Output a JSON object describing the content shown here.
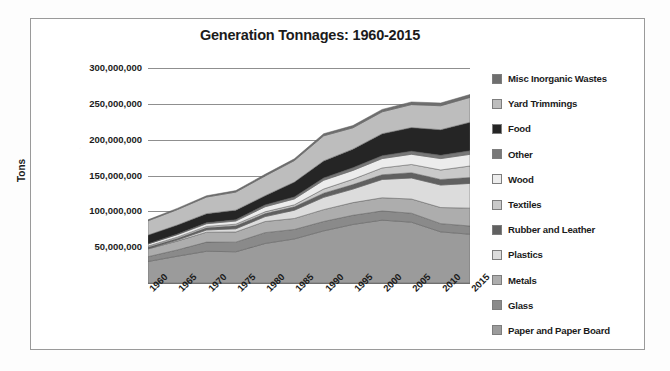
{
  "chart_data": {
    "type": "area",
    "stacked": true,
    "title": "Generation Tonnages: 1960-2015",
    "xlabel": "",
    "ylabel": "Tons",
    "grid": true,
    "legend_position": "right",
    "ylim": [
      0,
      300000000
    ],
    "yticks": [
      300000000,
      250000000,
      200000000,
      150000000,
      100000000,
      50000000
    ],
    "ytick_labels": [
      "300,000,000",
      "250,000,000",
      "200,000,000",
      "150,000,000",
      "100,000,000",
      "50,000,000"
    ],
    "x": [
      1960,
      1965,
      1970,
      1975,
      1980,
      1985,
      1990,
      1995,
      2000,
      2005,
      2010,
      2015
    ],
    "xtick_labels": [
      "1960",
      "1965",
      "1970",
      "1975",
      "1980",
      "1985",
      "1990",
      "1995",
      "2000",
      "2005",
      "2010",
      "2015"
    ],
    "series": [
      {
        "name": "Paper and Paper Board",
        "color": "#9b9b9b",
        "values": [
          29990000,
          37380000,
          44310000,
          43560000,
          55160000,
          61500000,
          72730000,
          81670000,
          87740000,
          84840000,
          71310000,
          68050000
        ]
      },
      {
        "name": "Glass",
        "color": "#8a8a8a",
        "values": [
          6720000,
          8740000,
          12740000,
          13470000,
          15130000,
          13200000,
          13100000,
          12830000,
          12770000,
          12540000,
          11530000,
          11470000
        ]
      },
      {
        "name": "Metals",
        "color": "#adadad",
        "values": [
          10820000,
          12360000,
          13830000,
          14180000,
          15510000,
          15330000,
          16550000,
          17660000,
          18420000,
          19800000,
          22430000,
          24950000
        ]
      },
      {
        "name": "Plastics",
        "color": "#dcdcdc",
        "values": [
          390000,
          1430000,
          3080000,
          4450000,
          6830000,
          11540000,
          17130000,
          18920000,
          25550000,
          29380000,
          31400000,
          34500000
        ]
      },
      {
        "name": "Rubber and Leather",
        "color": "#606060",
        "values": [
          1840000,
          2170000,
          2970000,
          4200000,
          4200000,
          4740000,
          5790000,
          6260000,
          6580000,
          7310000,
          7770000,
          8260000
        ]
      },
      {
        "name": "Textiles",
        "color": "#c9c9c9",
        "values": [
          1760000,
          1930000,
          2040000,
          2230000,
          2530000,
          2790000,
          5810000,
          7400000,
          9480000,
          11500000,
          13250000,
          16030000
        ]
      },
      {
        "name": "Wood",
        "color": "#ececec",
        "values": [
          3030000,
          3430000,
          3720000,
          4400000,
          7010000,
          8220000,
          12210000,
          12340000,
          13100000,
          14280000,
          15920000,
          16300000
        ]
      },
      {
        "name": "Other",
        "color": "#787878",
        "values": [
          70000,
          770000,
          1280000,
          1780000,
          2520000,
          2710000,
          3190000,
          3780000,
          4000000,
          4290000,
          4570000,
          4990000
        ]
      },
      {
        "name": "Food",
        "color": "#252525",
        "values": [
          12200000,
          12700000,
          12800000,
          13400000,
          13000000,
          20800000,
          23860000,
          25930000,
          30700000,
          32930000,
          35740000,
          39730000
        ]
      },
      {
        "name": "Yard Trimmings",
        "color": "#bdbdbd",
        "values": [
          20000000,
          21500000,
          23200000,
          25200000,
          27500000,
          30000000,
          35000000,
          29780000,
          30530000,
          32070000,
          33400000,
          34730000
        ]
      },
      {
        "name": "Misc Inorganic Wastes",
        "color": "#6e6e6e",
        "values": [
          1300000,
          1700000,
          1780000,
          2040000,
          2250000,
          2420000,
          2900000,
          3120000,
          3320000,
          3690000,
          3840000,
          4000000
        ]
      }
    ]
  },
  "legend": {
    "items": [
      {
        "label": "Misc Inorganic Wastes",
        "color": "#6e6e6e"
      },
      {
        "label": "Yard Trimmings",
        "color": "#bdbdbd"
      },
      {
        "label": "Food",
        "color": "#252525"
      },
      {
        "label": "Other",
        "color": "#787878"
      },
      {
        "label": "Wood",
        "color": "#ececec"
      },
      {
        "label": "Textiles",
        "color": "#c9c9c9"
      },
      {
        "label": "Rubber and Leather",
        "color": "#606060"
      },
      {
        "label": "Plastics",
        "color": "#dcdcdc"
      },
      {
        "label": "Metals",
        "color": "#adadad"
      },
      {
        "label": "Glass",
        "color": "#8a8a8a"
      },
      {
        "label": "Paper and Paper Board",
        "color": "#9b9b9b"
      }
    ]
  }
}
